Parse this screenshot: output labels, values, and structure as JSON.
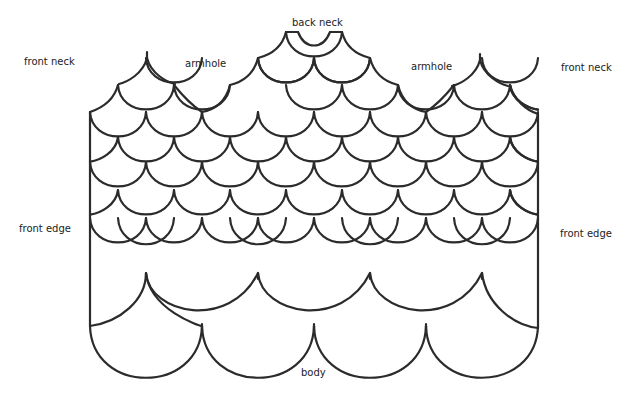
{
  "diagram": {
    "line_color": "#2b2b2b",
    "background": "#ffffff",
    "labels": {
      "back_neck": "back neck",
      "front_neck_left": "front neck",
      "front_neck_right": "front neck",
      "armhole_left": "armhole",
      "armhole_right": "armhole",
      "front_edge_left": "front edge",
      "front_edge_right": "front edge",
      "body": "body"
    },
    "geometry": {
      "left_edge_x": 90,
      "right_edge_x": 538,
      "scale_width": 56,
      "row_step": 52
    }
  }
}
